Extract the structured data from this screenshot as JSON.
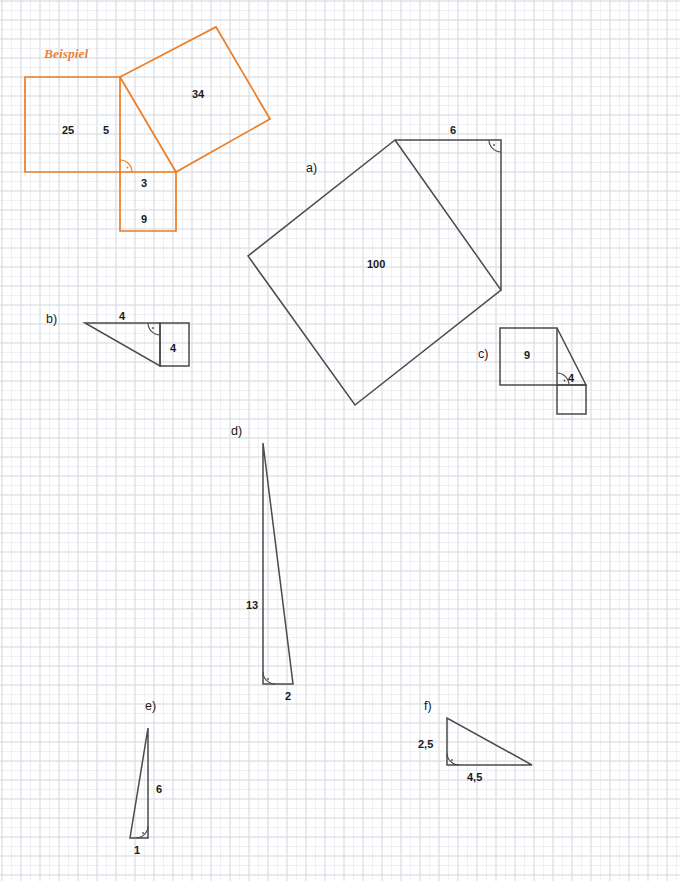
{
  "page": {
    "width": 680,
    "height": 881,
    "background": "#ffffff",
    "grid_minor_color": "#eef0f3",
    "grid_major_color": "#d8dce2",
    "stroke_color": "#4a4a4a",
    "example_color": "#ec7d24"
  },
  "example": {
    "label": "Beispiel",
    "squares": {
      "leg_a_area": "25",
      "leg_a_side": "5",
      "leg_b_area": "9",
      "leg_b_side": "3",
      "hypotenuse_area": "34"
    }
  },
  "tasks": {
    "a": {
      "marker": "a)",
      "square_area": "100",
      "leg_label": "6"
    },
    "b": {
      "marker": "b)",
      "top_label": "4",
      "square_label": "4"
    },
    "c": {
      "marker": "c)",
      "square_label": "9",
      "small_square_label": "4"
    },
    "d": {
      "marker": "d)",
      "vertical_label": "13",
      "horizontal_label": "2"
    },
    "e": {
      "marker": "e)",
      "vertical_label": "6",
      "horizontal_label": "1"
    },
    "f": {
      "marker": "f)",
      "vertical_label": "2,5",
      "horizontal_label": "4,5"
    }
  }
}
